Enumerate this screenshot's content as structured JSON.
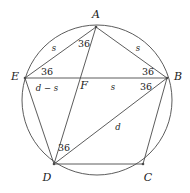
{
  "figure": {
    "stroke_color": "#4a4a4a",
    "text_color": "#1a1a1a",
    "background": "#ffffff",
    "width": 190,
    "height": 193
  },
  "circle": {
    "cx": 97,
    "cy": 100,
    "r": 75
  },
  "vertices": [
    {
      "name": "A",
      "label": "A",
      "x": 96,
      "y": 27,
      "label_x": 96,
      "label_y": 14
    },
    {
      "name": "B",
      "label": "B",
      "x": 167,
      "y": 78,
      "label_x": 178,
      "label_y": 76
    },
    {
      "name": "C",
      "label": "C",
      "x": 143,
      "y": 164,
      "label_x": 148,
      "label_y": 177
    },
    {
      "name": "D",
      "label": "D",
      "x": 54,
      "y": 164,
      "label_x": 47,
      "label_y": 177
    },
    {
      "name": "E",
      "label": "E",
      "x": 25,
      "y": 78,
      "label_x": 15,
      "label_y": 76
    },
    {
      "name": "F",
      "label": "F",
      "x": 79,
      "y": 78,
      "label_x": 84,
      "label_y": 85
    }
  ],
  "edges": [
    {
      "name": "side-EA",
      "from": "E",
      "to": "A"
    },
    {
      "name": "side-AB",
      "from": "A",
      "to": "B"
    },
    {
      "name": "side-BC",
      "from": "B",
      "to": "C"
    },
    {
      "name": "side-CD",
      "from": "C",
      "to": "D"
    },
    {
      "name": "side-DE",
      "from": "D",
      "to": "E"
    },
    {
      "name": "diagonal-EB",
      "from": "E",
      "to": "B"
    },
    {
      "name": "diagonal-AD",
      "from": "A",
      "to": "D"
    },
    {
      "name": "diagonal-DB",
      "from": "D",
      "to": "B"
    }
  ],
  "angle_labels": [
    {
      "name": "angle-at-A",
      "value": "36",
      "x": 84,
      "y": 44
    },
    {
      "name": "angle-at-E",
      "value": "36",
      "x": 47,
      "y": 72
    },
    {
      "name": "angle-at-B-upper",
      "value": "36",
      "x": 148,
      "y": 72
    },
    {
      "name": "angle-at-B-lower",
      "value": "36",
      "x": 146,
      "y": 87
    },
    {
      "name": "angle-at-D",
      "value": "36",
      "x": 64,
      "y": 148
    }
  ],
  "segment_labels": [
    {
      "name": "length-EA-s",
      "value": "s",
      "x": 54,
      "y": 48
    },
    {
      "name": "length-AB-s",
      "value": "s",
      "x": 138,
      "y": 48
    },
    {
      "name": "length-EF-d-s",
      "value": "d − s",
      "x": 47,
      "y": 88
    },
    {
      "name": "length-FB-s",
      "value": "s",
      "x": 113,
      "y": 87
    },
    {
      "name": "length-DB-d",
      "value": "d",
      "x": 118,
      "y": 127
    }
  ]
}
